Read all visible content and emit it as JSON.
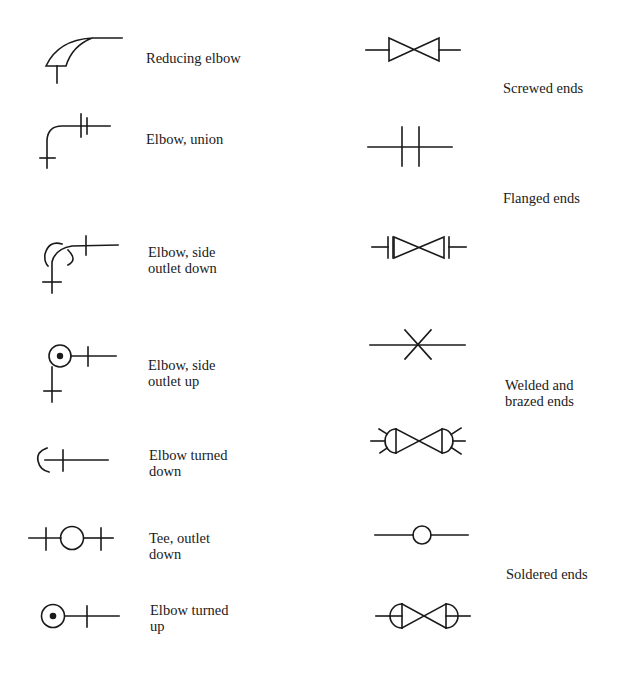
{
  "fittings": [
    {
      "id": "reducing-elbow",
      "lines": [
        "Reducing elbow"
      ]
    },
    {
      "id": "elbow-union",
      "lines": [
        "Elbow, union"
      ]
    },
    {
      "id": "elbow-side-outlet-down",
      "lines": [
        "Elbow, side",
        "outlet down"
      ]
    },
    {
      "id": "elbow-side-outlet-up",
      "lines": [
        "Elbow, side",
        "outlet up"
      ]
    },
    {
      "id": "elbow-turned-down",
      "lines": [
        "Elbow turned",
        "down"
      ]
    },
    {
      "id": "tee-outlet-down",
      "lines": [
        "Tee, outlet",
        "down"
      ]
    },
    {
      "id": "elbow-turned-up",
      "lines": [
        "Elbow turned",
        "up"
      ]
    }
  ],
  "end_types": [
    {
      "id": "screwed-ends",
      "lines": [
        "Screwed ends"
      ]
    },
    {
      "id": "flanged-ends",
      "lines": [
        "Flanged ends"
      ]
    },
    {
      "id": "welded-brazed-ends",
      "lines": [
        "Welded and",
        "brazed ends"
      ]
    },
    {
      "id": "soldered-ends",
      "lines": [
        "Soldered ends"
      ]
    }
  ],
  "colors": {
    "ink": "#1a1a1a",
    "background": "#ffffff"
  }
}
